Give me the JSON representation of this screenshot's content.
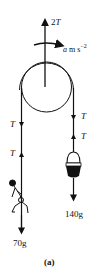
{
  "diagram": {
    "type": "pulley-free-body",
    "caption": "(a)",
    "support_force": {
      "label_coef": "2",
      "label_var": "T",
      "direction": "up"
    },
    "acceleration": {
      "var": "a",
      "unit": "m s",
      "exp": "−2",
      "direction": "rotation-right"
    },
    "left_side": {
      "tension_down": "T",
      "tension_up": "T",
      "object": "man climbing rope",
      "weight_label": "70g"
    },
    "right_side": {
      "tension_down": "T",
      "tension_up": "T",
      "object": "bucket",
      "weight_label": "140g"
    },
    "colors": {
      "ink": "#111111",
      "background": "#ffffff"
    }
  }
}
